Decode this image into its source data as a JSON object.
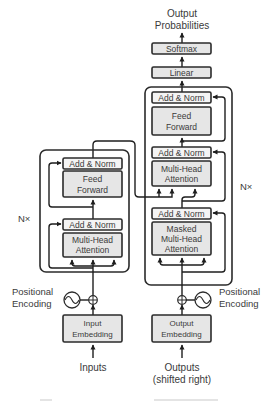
{
  "diagram": {
    "colors": {
      "background": "#ffffff",
      "block_fill": "#e6e6e6",
      "addnorm_fill": "#f4f4f4",
      "stroke": "#2b2b2b",
      "text": "#3a3a3a"
    },
    "output": {
      "label_line1": "Output",
      "label_line2": "Probabilities"
    },
    "decoder_head": {
      "softmax": "Softmax",
      "linear": "Linear"
    },
    "decoder": {
      "repeat_label": "N×",
      "ff_addnorm": "Add & Norm",
      "feed_forward_line1": "Feed",
      "feed_forward_line2": "Forward",
      "cross_addnorm": "Add & Norm",
      "cross_attention_line1": "Multi-Head",
      "cross_attention_line2": "Attention",
      "masked_addnorm": "Add & Norm",
      "masked_attention_line1": "Masked",
      "masked_attention_line2": "Multi-Head",
      "masked_attention_line3": "Attention"
    },
    "encoder": {
      "repeat_label": "N×",
      "ff_addnorm": "Add & Norm",
      "feed_forward_line1": "Feed",
      "feed_forward_line2": "Forward",
      "attn_addnorm": "Add & Norm",
      "attention_line1": "Multi-Head",
      "attention_line2": "Attention"
    },
    "encoder_input": {
      "positional_line1": "Positional",
      "positional_line2": "Encoding",
      "embedding_line1": "Input",
      "embedding_line2": "Embedding",
      "source_label": "Inputs"
    },
    "decoder_input": {
      "positional_line1": "Positional",
      "positional_line2": "Encoding",
      "embedding_line1": "Output",
      "embedding_line2": "Embedding",
      "source_line1": "Outputs",
      "source_line2": "(shifted right)"
    },
    "icons": {
      "sum": "circled-plus-icon",
      "positional": "sine-wave-icon",
      "arrow": "arrow-up-icon"
    }
  }
}
